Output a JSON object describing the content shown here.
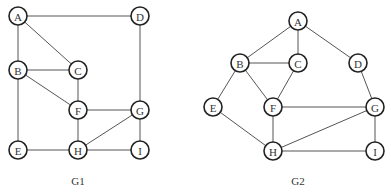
{
  "graphs": [
    {
      "caption": "G1",
      "caption_pos": [
        78,
        185
      ],
      "node_radius": 9,
      "nodes": [
        {
          "id": "A",
          "label": "A",
          "x": 18,
          "y": 16
        },
        {
          "id": "D",
          "label": "D",
          "x": 140,
          "y": 16
        },
        {
          "id": "B",
          "label": "B",
          "x": 18,
          "y": 70
        },
        {
          "id": "C",
          "label": "C",
          "x": 78,
          "y": 70
        },
        {
          "id": "F",
          "label": "F",
          "x": 78,
          "y": 110
        },
        {
          "id": "G",
          "label": "G",
          "x": 140,
          "y": 110
        },
        {
          "id": "E",
          "label": "E",
          "x": 18,
          "y": 150
        },
        {
          "id": "H",
          "label": "H",
          "x": 78,
          "y": 150
        },
        {
          "id": "I",
          "label": "I",
          "x": 140,
          "y": 150
        }
      ],
      "edges": [
        [
          "A",
          "D"
        ],
        [
          "A",
          "B"
        ],
        [
          "A",
          "C"
        ],
        [
          "B",
          "C"
        ],
        [
          "B",
          "F"
        ],
        [
          "B",
          "E"
        ],
        [
          "C",
          "F"
        ],
        [
          "D",
          "G"
        ],
        [
          "F",
          "G"
        ],
        [
          "F",
          "H"
        ],
        [
          "G",
          "H"
        ],
        [
          "G",
          "I"
        ],
        [
          "E",
          "H"
        ],
        [
          "H",
          "I"
        ]
      ]
    },
    {
      "caption": "G2",
      "caption_pos": [
        298,
        185
      ],
      "node_radius": 9,
      "nodes": [
        {
          "id": "A",
          "label": "A",
          "x": 298,
          "y": 21
        },
        {
          "id": "B",
          "label": "B",
          "x": 240,
          "y": 63
        },
        {
          "id": "C",
          "label": "C",
          "x": 298,
          "y": 63
        },
        {
          "id": "D",
          "label": "D",
          "x": 358,
          "y": 63
        },
        {
          "id": "E",
          "label": "E",
          "x": 213,
          "y": 107
        },
        {
          "id": "F",
          "label": "F",
          "x": 273,
          "y": 107
        },
        {
          "id": "G",
          "label": "G",
          "x": 375,
          "y": 107
        },
        {
          "id": "H",
          "label": "H",
          "x": 273,
          "y": 151
        },
        {
          "id": "I",
          "label": "I",
          "x": 375,
          "y": 151
        }
      ],
      "edges": [
        [
          "A",
          "B"
        ],
        [
          "A",
          "C"
        ],
        [
          "A",
          "D"
        ],
        [
          "B",
          "C"
        ],
        [
          "B",
          "E"
        ],
        [
          "B",
          "F"
        ],
        [
          "C",
          "F"
        ],
        [
          "D",
          "G"
        ],
        [
          "E",
          "H"
        ],
        [
          "F",
          "G"
        ],
        [
          "F",
          "H"
        ],
        [
          "G",
          "H"
        ],
        [
          "G",
          "I"
        ],
        [
          "H",
          "I"
        ]
      ]
    }
  ]
}
